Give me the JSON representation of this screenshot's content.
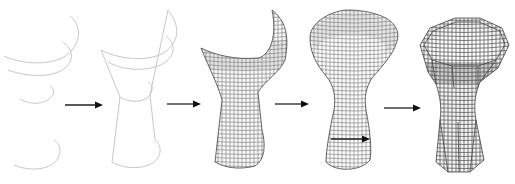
{
  "figure": {
    "background": "#ffffff",
    "stages": [
      {
        "id": 1,
        "name": "profile-curves",
        "label": ""
      },
      {
        "id": 2,
        "name": "wireframe-skeleton",
        "label": ""
      },
      {
        "id": 3,
        "name": "partial-surface-mesh",
        "label": ""
      },
      {
        "id": 4,
        "name": "revolved-surface-mesh",
        "label": ""
      },
      {
        "id": 5,
        "name": "octagonal-final-mesh",
        "label": ""
      }
    ],
    "arrows": [
      {
        "from": 1,
        "to": 2,
        "x1": 65,
        "x2": 103,
        "y": 105
      },
      {
        "from": 2,
        "to": 3,
        "x1": 167,
        "x2": 201,
        "y": 104
      },
      {
        "from": 3,
        "to": 4,
        "x1": 275,
        "x2": 309,
        "y": 104
      },
      {
        "from": 4,
        "to": 5,
        "x1": 384,
        "x2": 421,
        "y": 108
      }
    ],
    "inner_arrow": {
      "stage": 4,
      "x1": 331,
      "x2": 370,
      "y": 139
    },
    "colors": {
      "curve": "#c8c8c8",
      "mesh": "#555555",
      "arrow": "#111111"
    }
  }
}
